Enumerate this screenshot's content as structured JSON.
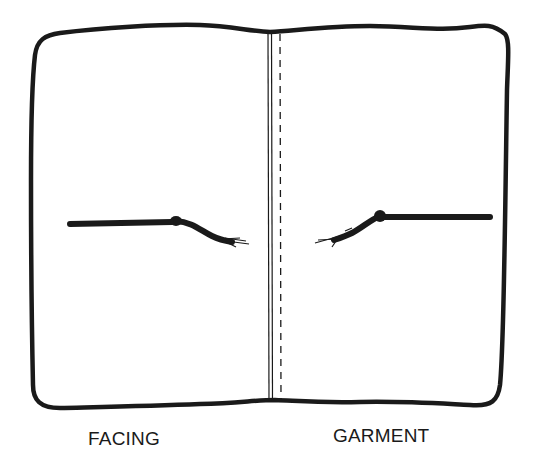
{
  "diagram": {
    "type": "sewing-illustration",
    "colors": {
      "ink": "#1a1a1a",
      "background": "#ffffff"
    },
    "labels": {
      "left": "FACING",
      "right": "GARMENT"
    },
    "elements": [
      {
        "name": "fabric-outline",
        "kind": "rounded-rectangle-wavy"
      },
      {
        "name": "fold-line",
        "kind": "double-solid-vertical"
      },
      {
        "name": "stitching-line",
        "kind": "dashed-vertical"
      },
      {
        "name": "facing-slit",
        "kind": "cut-line-with-frayed-end",
        "side": "left"
      },
      {
        "name": "garment-slit",
        "kind": "cut-line-with-frayed-end",
        "side": "right"
      }
    ]
  }
}
